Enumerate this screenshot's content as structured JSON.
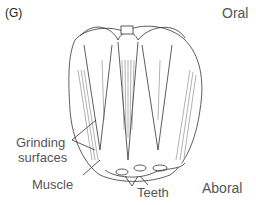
{
  "figure": {
    "panel_label": "(G)",
    "labels": {
      "oral": "Oral",
      "aboral": "Aboral",
      "grinding_surfaces_line1": "Grinding",
      "grinding_surfaces_line2": "surfaces",
      "muscle": "Muscle",
      "teeth": "Teeth"
    },
    "colors": {
      "line": "#333333",
      "label": "#555555",
      "background": "#ffffff"
    }
  }
}
